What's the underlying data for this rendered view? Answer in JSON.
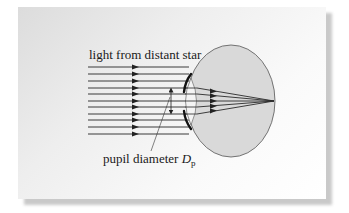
{
  "figure": {
    "labels": {
      "incoming_light": "light from distant star",
      "pupil_label_text": "pupil diameter ",
      "pupil_symbol": "D",
      "pupil_subscript": "p"
    },
    "rays": {
      "count": 11,
      "x_start": 88,
      "x_end": 189,
      "arrow_x": 136,
      "y_positions": [
        67,
        74,
        81,
        88,
        94,
        101,
        107,
        114,
        120,
        127,
        134
      ]
    },
    "converging_rays": {
      "count": 5,
      "from_y": [
        88,
        94,
        101,
        107,
        114
      ],
      "arrow_x": 213,
      "focal_point": [
        274,
        101
      ]
    },
    "eye": {
      "center": [
        231,
        101
      ],
      "rx": 44,
      "ry": 56,
      "fill": "#d9d9d9",
      "stroke": "#555555"
    },
    "pupil_arrow": {
      "x": 171,
      "y_top": 88,
      "y_bottom": 114
    },
    "colors": {
      "ray": "#3a3a3a",
      "iris": "#111111",
      "lens_fill": "#f4f4f4"
    }
  }
}
